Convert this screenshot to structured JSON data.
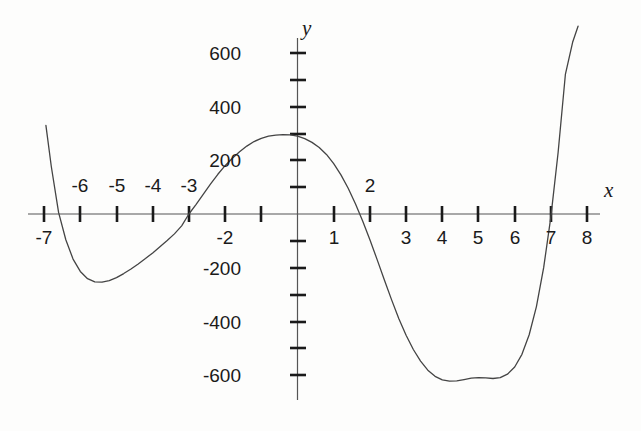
{
  "figure": {
    "background_color": "#fdfdfc",
    "axis_color": "#555555",
    "curve_color": "#444444",
    "text_color": "#1a1a1a",
    "x_axis_name": "x",
    "y_axis_name": "y"
  },
  "chart_data": {
    "type": "line",
    "title": "",
    "xlabel": "x",
    "ylabel": "y",
    "xlim": [
      -7.4,
      8.5
    ],
    "ylim": [
      -700,
      700
    ],
    "grid": false,
    "legend": "none",
    "x_tick_labels": [
      "-7",
      "-6",
      "-5",
      "-4",
      "-3",
      "-2",
      "1",
      "2",
      "3",
      "4",
      "5",
      "6",
      "7",
      "8"
    ],
    "x_tick_values": [
      -7,
      -6,
      -5,
      -4,
      -3,
      -2,
      1,
      2,
      3,
      4,
      5,
      6,
      7,
      8
    ],
    "x_ticks_all": [
      -7,
      -6,
      -5,
      -4,
      -3,
      -2,
      -1,
      1,
      2,
      3,
      4,
      5,
      6,
      7,
      8
    ],
    "x_labels_above_axis": [
      "-6",
      "-5",
      "-4",
      "-3",
      "2"
    ],
    "x_labels_below_axis": [
      "-7",
      "-2",
      "1",
      "3",
      "4",
      "5",
      "6",
      "7",
      "8"
    ],
    "y_tick_labels": [
      "600",
      "400",
      "200",
      "-200",
      "-400",
      "-600"
    ],
    "y_tick_values": [
      600,
      400,
      200,
      -200,
      -400,
      -600
    ],
    "y_ticks_all": [
      -600,
      -500,
      -400,
      -300,
      -200,
      -100,
      100,
      200,
      300,
      400,
      500,
      600
    ],
    "roots": [
      -6.55,
      -3.0,
      1.5,
      7.3
    ],
    "local_maximum": {
      "x": -0.2,
      "y": 295
    },
    "local_minima": [
      {
        "x": -5.1,
        "y": -230
      },
      {
        "x": 5.3,
        "y": -615
      }
    ],
    "series": [
      {
        "name": "quartic curve",
        "x": [
          -6.95,
          -6.8,
          -6.6,
          -6.4,
          -6.2,
          -6.0,
          -5.8,
          -5.6,
          -5.4,
          -5.2,
          -5.0,
          -4.8,
          -4.6,
          -4.4,
          -4.2,
          -4.0,
          -3.8,
          -3.6,
          -3.4,
          -3.2,
          -3.0,
          -2.8,
          -2.6,
          -2.4,
          -2.2,
          -2.0,
          -1.8,
          -1.6,
          -1.4,
          -1.2,
          -1.0,
          -0.8,
          -0.6,
          -0.4,
          -0.2,
          0.0,
          0.2,
          0.4,
          0.6,
          0.8,
          1.0,
          1.2,
          1.4,
          1.6,
          1.8,
          2.0,
          2.2,
          2.4,
          2.6,
          2.8,
          3.0,
          3.2,
          3.4,
          3.6,
          3.8,
          4.0,
          4.2,
          4.4,
          4.6,
          4.8,
          5.0,
          5.2,
          5.4,
          5.6,
          5.8,
          6.0,
          6.2,
          6.4,
          6.6,
          6.8,
          7.0,
          7.2,
          7.4,
          7.6,
          7.75
        ],
        "y": [
          330,
          176,
          6,
          -96,
          -168,
          -214,
          -241,
          -253,
          -254,
          -248,
          -237,
          -222,
          -205,
          -186,
          -166,
          -145,
          -122,
          -99,
          -74,
          -44,
          0,
          36,
          74,
          112,
          148,
          180,
          208,
          232,
          253,
          270,
          282,
          290,
          294,
          296,
          295,
          290,
          281,
          267,
          248,
          222,
          188,
          146,
          96,
          38,
          -26,
          -96,
          -170,
          -246,
          -320,
          -390,
          -452,
          -505,
          -548,
          -582,
          -605,
          -618,
          -623,
          -622,
          -617,
          -612,
          -610,
          -611,
          -613,
          -610,
          -597,
          -570,
          -523,
          -450,
          -345,
          -200,
          -10,
          230,
          520,
          640,
          700
        ]
      }
    ]
  },
  "y_tick_positions_px": [
    {
      "label": "600",
      "y": 53
    },
    {
      "label": "400",
      "y": 107
    },
    {
      "label": "200",
      "y": 160
    },
    {
      "label": "-200",
      "y": 268
    },
    {
      "label": "-400",
      "y": 322
    },
    {
      "label": "-600",
      "y": 375
    }
  ],
  "x_tick_positions_px": [
    {
      "label": "-7",
      "x": 44,
      "above": false
    },
    {
      "label": "-6",
      "x": 80,
      "above": true
    },
    {
      "label": "-5",
      "x": 117,
      "above": true
    },
    {
      "label": "-4",
      "x": 153,
      "above": true
    },
    {
      "label": "-3",
      "x": 189,
      "above": true
    },
    {
      "label": "-2",
      "x": 225,
      "above": false
    },
    {
      "label": "1",
      "x": 334,
      "above": false
    },
    {
      "label": "2",
      "x": 370,
      "above": true
    },
    {
      "label": "3",
      "x": 406,
      "above": false
    },
    {
      "label": "4",
      "x": 442,
      "above": false
    },
    {
      "label": "5",
      "x": 478,
      "above": false
    },
    {
      "label": "6",
      "x": 515,
      "above": false
    },
    {
      "label": "7",
      "x": 551,
      "above": false
    },
    {
      "label": "8",
      "x": 587,
      "above": false
    }
  ]
}
